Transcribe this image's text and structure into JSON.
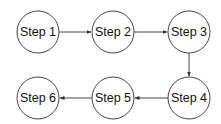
{
  "diagram": {
    "type": "flowchart",
    "nodes": [
      {
        "id": "step1",
        "label": "Step 1",
        "cx": 38,
        "cy": 32
      },
      {
        "id": "step2",
        "label": "Step 2",
        "cx": 113,
        "cy": 32
      },
      {
        "id": "step3",
        "label": "Step 3",
        "cx": 189,
        "cy": 32
      },
      {
        "id": "step4",
        "label": "Step 4",
        "cx": 189,
        "cy": 98
      },
      {
        "id": "step5",
        "label": "Step 5",
        "cx": 113,
        "cy": 98
      },
      {
        "id": "step6",
        "label": "Step 6",
        "cx": 38,
        "cy": 98
      }
    ],
    "edges": [
      {
        "from": "step1",
        "to": "step2"
      },
      {
        "from": "step2",
        "to": "step3"
      },
      {
        "from": "step3",
        "to": "step4"
      },
      {
        "from": "step4",
        "to": "step5"
      },
      {
        "from": "step5",
        "to": "step6"
      }
    ],
    "node_radius": 21,
    "colors": {
      "stroke": "#333333",
      "fill": "#ffffff",
      "text": "#111111"
    }
  }
}
